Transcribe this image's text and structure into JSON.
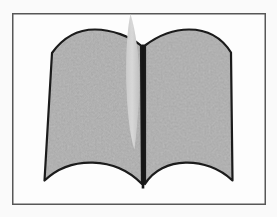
{
  "figure": {
    "name": "open-book-illustration"
  },
  "colors": {
    "background": "#fafafa",
    "frame_fill": "#fdfdfd",
    "frame_border": "#575757",
    "page_fill": "#aaaaaa",
    "page_outline": "#1b1b1b",
    "spine": "#161616",
    "ribbon_light": "#d8d8d8",
    "ribbon_mid": "#cbcbcb",
    "ribbon_dark": "#bdbdbd",
    "grain_speck": "#d2d2d2"
  }
}
